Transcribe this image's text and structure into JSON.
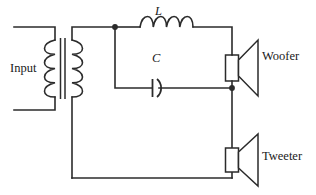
{
  "figure": {
    "type": "schematic-circuit-diagram",
    "background_color": "#ffffff",
    "line_color": "#2b2b2b"
  },
  "labels": {
    "input": "Input",
    "inductor": "L",
    "capacitor": "C",
    "woofer": "Woofer",
    "tweeter": "Tweeter"
  },
  "components": [
    {
      "name": "transformer",
      "kind": "iron-core-transformer",
      "primary_turns": 4,
      "secondary_turns": 4,
      "core_lines": 2
    },
    {
      "name": "inductor",
      "kind": "air-core-inductor",
      "label": "L",
      "turns": 4,
      "branch": "woofer-series"
    },
    {
      "name": "capacitor",
      "kind": "polarized-curved-plate-capacitor",
      "label": "C",
      "branch": "parallel-shunt"
    },
    {
      "name": "woofer",
      "kind": "loudspeaker",
      "label": "Woofer",
      "position": "upper-right"
    },
    {
      "name": "tweeter",
      "kind": "loudspeaker",
      "label": "Tweeter",
      "position": "lower-right"
    }
  ],
  "nodes": [
    {
      "name": "left-branch-node",
      "x": 115,
      "y": 27
    },
    {
      "name": "right-branch-node",
      "x": 232,
      "y": 88
    }
  ]
}
